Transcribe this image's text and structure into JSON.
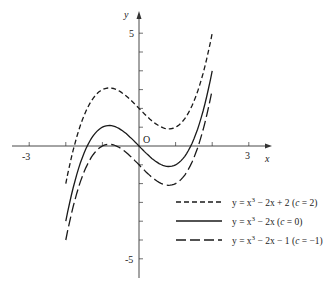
{
  "chart_data": {
    "type": "line",
    "title": "",
    "xlabel": "x",
    "ylabel": "y",
    "origin_label": "O",
    "x_ticks": [
      -3,
      -2,
      -1,
      1,
      2,
      3
    ],
    "x_tick_labels": [
      {
        "value": -3,
        "label": "-3"
      },
      {
        "value": 3,
        "label": "3"
      }
    ],
    "y_tick_labels": [
      {
        "value": 6,
        "label": "5"
      },
      {
        "value": -6,
        "label": "-5"
      }
    ],
    "y_ticks": [
      -6,
      -5,
      -4,
      -3,
      -2,
      -1,
      1,
      2,
      3,
      4,
      5,
      6
    ],
    "xlim": [
      -3.8,
      3.6
    ],
    "ylim": [
      -7.5,
      7.2
    ],
    "grid": false,
    "legend_position": "lower right",
    "series": [
      {
        "name": "y = x³ − 2x + 2 (c = 2)",
        "c": 2,
        "style": "dashed",
        "x_range": [
          -2,
          2
        ],
        "x": [
          -2,
          -1.5,
          -1,
          -0.816,
          -0.5,
          0,
          0.5,
          0.816,
          1,
          1.5,
          2
        ],
        "values": [
          -2,
          1.625,
          3,
          3.089,
          2.875,
          2,
          1.125,
          0.911,
          1,
          2.375,
          6
        ]
      },
      {
        "name": "y = x³ − 2x (c = 0)",
        "c": 0,
        "style": "solid",
        "x_range": [
          -2,
          2
        ],
        "x": [
          -2,
          -1.5,
          -1,
          -0.816,
          -0.5,
          0,
          0.5,
          0.816,
          1,
          1.5,
          2
        ],
        "values": [
          -4,
          -0.375,
          1,
          1.089,
          0.875,
          0,
          -0.875,
          -1.089,
          -1,
          0.375,
          4
        ]
      },
      {
        "name": "y = x³ − 2x − 1 (c = −1)",
        "c": -1,
        "style": "longdash",
        "x_range": [
          -2,
          2
        ],
        "x": [
          -2,
          -1.5,
          -1,
          -0.816,
          -0.5,
          0,
          0.5,
          0.816,
          1,
          1.5,
          2
        ],
        "values": [
          -5,
          -1.375,
          0,
          0.089,
          -0.125,
          -1,
          -1.875,
          -2.089,
          -2,
          -0.625,
          3
        ]
      }
    ]
  },
  "legend": [
    {
      "style": "dashed",
      "text_pre": "y = x",
      "sup": "3",
      "text_post": " − 2x + 2 (",
      "c_var": "c",
      "c_post": " = 2)"
    },
    {
      "style": "solid",
      "text_pre": "y = x",
      "sup": "3",
      "text_post": " − 2x (",
      "c_var": "c",
      "c_post": " = 0)"
    },
    {
      "style": "longdash",
      "text_pre": "y = x",
      "sup": "3",
      "text_post": " − 2x − 1 (",
      "c_var": "c",
      "c_post": " = −1)"
    }
  ],
  "colors": {
    "line": "#1a1a1a",
    "axis": "#333333",
    "background": "#ffffff"
  }
}
